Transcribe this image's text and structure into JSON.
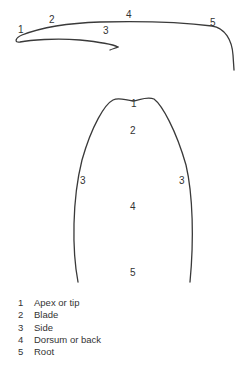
{
  "side_view": {
    "labels": [
      {
        "id": "1",
        "x": 18,
        "y": 33
      },
      {
        "id": "2",
        "x": 49,
        "y": 23
      },
      {
        "id": "3",
        "x": 104,
        "y": 34
      },
      {
        "id": "4",
        "x": 126,
        "y": 18
      },
      {
        "id": "5",
        "x": 211,
        "y": 26
      }
    ]
  },
  "top_view": {
    "labels": [
      {
        "id": "1",
        "x": 130,
        "y": 107
      },
      {
        "id": "2",
        "x": 130,
        "y": 134
      },
      {
        "id": "3",
        "x": 80,
        "y": 184
      },
      {
        "id": "3b",
        "text": "3",
        "x": 179,
        "y": 184
      },
      {
        "id": "4",
        "x": 130,
        "y": 210
      },
      {
        "id": "5",
        "x": 130,
        "y": 276
      }
    ]
  },
  "legend": {
    "items": [
      {
        "num": "1",
        "label": "Apex or tip"
      },
      {
        "num": "2",
        "label": "Blade"
      },
      {
        "num": "3",
        "label": "Side"
      },
      {
        "num": "4",
        "label": "Dorsum or back"
      },
      {
        "num": "5",
        "label": "Root"
      }
    ]
  },
  "colors": {
    "stroke": "#3a3a3a",
    "text": "#333333",
    "background": "#ffffff"
  }
}
